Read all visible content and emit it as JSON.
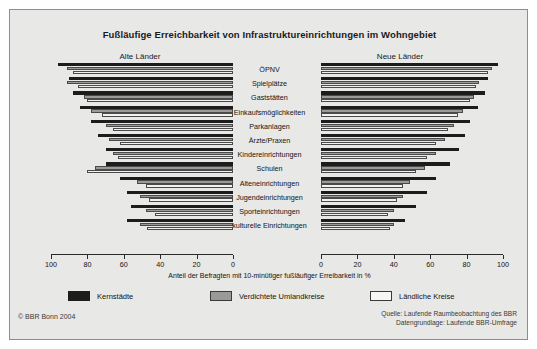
{
  "figure": {
    "title": "Fußläufige Erreichbarkeit von Infrastruktureinrichtungen im Wohngebiet",
    "panel_left_title": "Alte Länder",
    "panel_right_title": "Neue Länder",
    "axis_title": "Anteil der Befragten mit 10-minütiger fußläufiger Erreibarkeit in %",
    "copyright": "© BBR Bonn 2004",
    "source_line1": "Quelle: Laufende Raumbeobachtung des BBR",
    "source_line2": "Datengrundlage: Laufende BBR-Umfrage"
  },
  "legend": {
    "items": [
      {
        "label": "Kernstädte",
        "color": "#1c1c1c",
        "key": "kernstaedte"
      },
      {
        "label": "Verdichtete Umlandkreise",
        "color": "#9a9a98",
        "key": "verdichtete"
      },
      {
        "label": "Ländliche Kreise",
        "color": "#f6f6f4",
        "key": "laendliche"
      }
    ]
  },
  "ticks": {
    "left": [
      "100",
      "80",
      "60",
      "40",
      "20",
      "0"
    ],
    "right": [
      "0",
      "20",
      "40",
      "60",
      "80",
      "100"
    ]
  },
  "chart_data": {
    "type": "bar",
    "orientation": "horizontal",
    "title": "Fußläufige Erreichbarkeit von Infrastruktureinrichtungen im Wohngebiet",
    "xlabel": "Anteil der Befragten mit 10-minütiger fußläufiger Erreibarkeit in %",
    "ylabel": "",
    "xlim": [
      0,
      100
    ],
    "grid": false,
    "legend_position": "bottom",
    "panels": [
      "Alte Länder",
      "Neue Länder"
    ],
    "categories": [
      "ÖPNV",
      "Spielplätze",
      "Gaststätten",
      "Einkaufsmöglichkeiten",
      "Parkanlagen",
      "Ärzte/Praxen",
      "Kindereinrichtungen",
      "Schulen",
      "Alteneinrichtungen",
      "Jugendeinrichtungen",
      "Sporteinrichtungen",
      "kulturelle Einrichtungen"
    ],
    "series": [
      {
        "name": "Kernstädte",
        "panel": "Alte Länder",
        "color": "#1c1c1c",
        "values": [
          96,
          90,
          88,
          84,
          78,
          74,
          70,
          70,
          62,
          58,
          56,
          58
        ]
      },
      {
        "name": "Verdichtete Umlandkreise",
        "panel": "Alte Länder",
        "color": "#9a9a98",
        "values": [
          91,
          91,
          82,
          78,
          70,
          68,
          66,
          76,
          53,
          51,
          48,
          51
        ]
      },
      {
        "name": "Ländliche Kreise",
        "panel": "Alte Länder",
        "color": "#f2f2f0",
        "values": [
          88,
          85,
          80,
          72,
          66,
          62,
          63,
          80,
          48,
          46,
          43,
          47
        ]
      },
      {
        "name": "Kernstädte",
        "panel": "Neue Länder",
        "color": "#1c1c1c",
        "values": [
          97,
          92,
          90,
          86,
          82,
          79,
          76,
          71,
          63,
          58,
          52,
          46
        ]
      },
      {
        "name": "Verdichtete Umlandkreise",
        "panel": "Neue Länder",
        "color": "#9a9a98",
        "values": [
          94,
          87,
          84,
          78,
          73,
          68,
          63,
          57,
          49,
          45,
          40,
          40
        ]
      },
      {
        "name": "Ländliche Kreise",
        "panel": "Neue Länder",
        "color": "#f2f2f0",
        "values": [
          92,
          85,
          82,
          75,
          70,
          63,
          58,
          52,
          45,
          42,
          37,
          38
        ]
      }
    ]
  }
}
